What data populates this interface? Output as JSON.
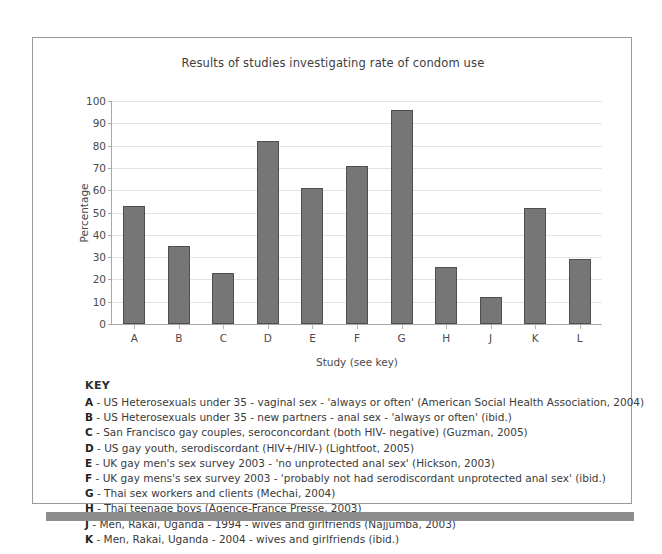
{
  "chart_data": {
    "type": "bar",
    "title": "Results of studies investigating rate of condom use",
    "xlabel": "Study (see key)",
    "ylabel": "Percentage",
    "categories": [
      "A",
      "B",
      "C",
      "D",
      "E",
      "F",
      "G",
      "H",
      "J",
      "K",
      "L"
    ],
    "values": [
      53,
      35,
      23,
      82,
      61,
      71,
      96,
      25.5,
      12,
      52,
      29
    ],
    "ylim": [
      0,
      100
    ],
    "yticks": [
      0,
      10,
      20,
      30,
      40,
      50,
      60,
      70,
      80,
      90,
      100
    ],
    "grid": true,
    "legend": "none",
    "bar_color": "#767676",
    "bar_edge_color": "#4f4f4f",
    "gridline_color": "#e2e2e2"
  },
  "key": {
    "heading": "KEY",
    "entries": [
      {
        "letter": "A",
        "text": " - US Heterosexuals under 35 - vaginal sex - 'always or often' (American Social Health Association, 2004)"
      },
      {
        "letter": "B",
        "text": " - US Heterosexuals under 35 - new partners - anal sex - 'always or often' (ibid.)"
      },
      {
        "letter": "C",
        "text": " - San Francisco gay couples, seroconcordant (both HIV- negative) (Guzman, 2005)"
      },
      {
        "letter": "D",
        "text": " - US gay youth, serodiscordant (HIV+/HIV-) (Lightfoot, 2005)"
      },
      {
        "letter": "E",
        "text": " - UK gay men's sex survey 2003 - 'no unprotected anal sex' (Hickson, 2003)"
      },
      {
        "letter": "F",
        "text": " - UK gay mens's sex survey 2003 - 'probably not had serodiscordant unprotected anal sex' (ibid.)"
      },
      {
        "letter": "G",
        "text": " - Thai sex workers and clients (Mechai, 2004)"
      },
      {
        "letter": "H",
        "text": " - Thai teenage boys (Agence-France Presse, 2003)"
      },
      {
        "letter": "J",
        "text": " - Men, Rakai, Uganda - 1994 - wives and girlfriends (Najjumba, 2003)"
      },
      {
        "letter": "K",
        "text": " - Men, Rakai, Uganda - 2004 - wives and girlfriends (ibid.)"
      }
    ]
  }
}
